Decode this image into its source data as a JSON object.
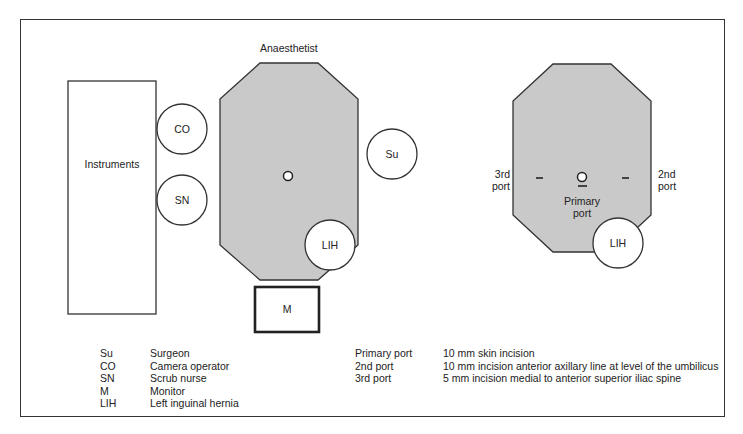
{
  "diagram": {
    "left_layout": {
      "anaesthetist_label": "Anaesthetist",
      "instruments_label": "Instruments",
      "circles": {
        "co": "CO",
        "sn": "SN",
        "su": "Su",
        "lih": "LIH"
      },
      "monitor_label": "M"
    },
    "right_layout": {
      "third_port_label": [
        "3rd",
        "port"
      ],
      "second_port_label": [
        "2nd",
        "port"
      ],
      "primary_port_label": [
        "Primary",
        "port"
      ],
      "lih_label": "LIH"
    },
    "colors": {
      "table_fill": "#c8c8c8",
      "stroke": "#333333",
      "background": "#ffffff"
    }
  },
  "legend_roles": [
    {
      "abbr": "Su",
      "meaning": "Surgeon"
    },
    {
      "abbr": "CO",
      "meaning": "Camera operator"
    },
    {
      "abbr": "SN",
      "meaning": "Scrub nurse"
    },
    {
      "abbr": "M",
      "meaning": "Monitor"
    },
    {
      "abbr": "LIH",
      "meaning": "Left inguinal hernia"
    }
  ],
  "legend_ports": [
    {
      "port": "Primary port",
      "description": "10 mm skin incision"
    },
    {
      "port": "2nd port",
      "description": "10 mm incision anterior axillary line at level of the umbilicus"
    },
    {
      "port": "3rd port",
      "description": "5 mm incision medial to anterior superior iliac spine"
    }
  ]
}
